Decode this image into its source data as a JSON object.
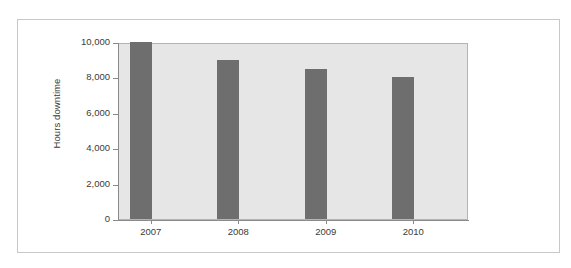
{
  "chart_data": {
    "type": "bar",
    "title": "",
    "subtitle": "",
    "xlabel": "",
    "ylabel": "Hours downtime",
    "categories": [
      "2007",
      "2008",
      "2009",
      "2010"
    ],
    "values": [
      10000,
      9000,
      8500,
      8000
    ],
    "series": [
      {
        "name": "Hours downtime",
        "values": [
          10000,
          9000,
          8500,
          8000
        ]
      }
    ],
    "ylim": [
      0,
      10000
    ],
    "ytick_values": [
      0,
      2000,
      4000,
      6000,
      8000,
      10000
    ],
    "ytick_labels": [
      "0",
      "2,000",
      "4,000",
      "6,000",
      "8,000",
      "10,000"
    ],
    "grid": false,
    "legend": false,
    "legend_position": "none",
    "bar_color": "#6e6e6e",
    "plot_background": "#e6e6e6",
    "figure_background": "#ffffff",
    "axis_color": "#8a8a8a",
    "text_color": "#3a3a3a"
  },
  "axes": {
    "y_title": "Hours downtime"
  }
}
